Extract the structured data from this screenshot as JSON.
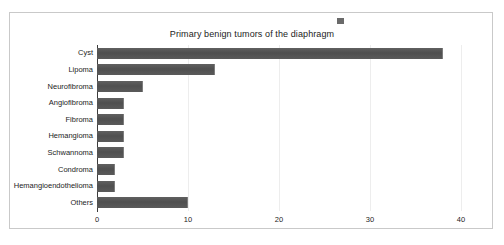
{
  "chart_data": {
    "type": "bar",
    "orientation": "horizontal",
    "title": "Primary benign tumors of the diaphragm",
    "xlabel": "",
    "ylabel": "",
    "categories": [
      "Cyst",
      "Lipoma",
      "Neurofibroma",
      "Angiofibroma",
      "Fibroma",
      "Hemangioma",
      "Schwannoma",
      "Condroma",
      "Hemangioendothelioma",
      "Others"
    ],
    "values": [
      38,
      13,
      5,
      3,
      3,
      3,
      3,
      2,
      2,
      10
    ],
    "xlim": [
      0,
      40
    ],
    "xticks": [
      0,
      10,
      20,
      30,
      40
    ],
    "xtick_labels": [
      "0",
      "10",
      "20",
      "30",
      "40"
    ],
    "grid": "vertical-light",
    "legend": {
      "visible": true,
      "position": "top-center",
      "marker_color": "#6a6a6a",
      "label": ""
    },
    "series": [
      {
        "name": "",
        "color": "#565656",
        "values": [
          38,
          13,
          5,
          3,
          3,
          3,
          3,
          2,
          2,
          10
        ]
      }
    ]
  },
  "colors": {
    "bar": "#565656",
    "bar_edge": "#7d7d7d",
    "axis": "#3c3c3c",
    "gridline": "#ededed",
    "frame_border": "#c9c9c9",
    "text": "#1c1c1c",
    "background": "#ffffff"
  }
}
